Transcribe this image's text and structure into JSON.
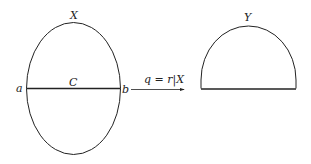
{
  "diagram": {
    "left_shape": {
      "label": "X",
      "chord_label": "C",
      "left_point": "a",
      "right_point": "b"
    },
    "arrow": {
      "label": "q = r|X"
    },
    "right_shape": {
      "label": "Y"
    },
    "colors": {
      "stroke": "#222222",
      "background": "#ffffff"
    }
  }
}
